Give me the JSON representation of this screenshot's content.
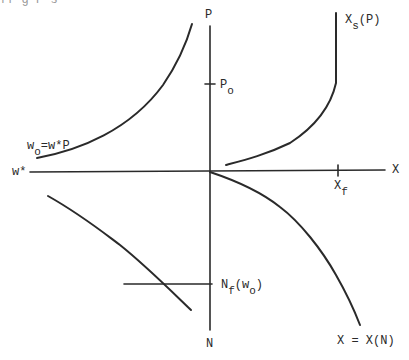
{
  "figure": {
    "top_fragment_text": "ff g    P  s",
    "axes": {
      "vertical_top_label": "P",
      "vertical_bottom_label": "N",
      "horizontal_right_label": "X",
      "horizontal_left_label": "w*"
    },
    "ticks": {
      "p0": {
        "main": "P",
        "sub": "o"
      },
      "xf": {
        "main": "X",
        "sub": "f"
      },
      "nf": {
        "main": "N",
        "sub": "f",
        "arg_open": "(w",
        "arg_sub": "o",
        "arg_close": ")"
      }
    },
    "curve_labels": {
      "xs": {
        "main": "X",
        "sub": "s",
        "rest": "(P)"
      },
      "w0": {
        "main": "w",
        "sub": "o",
        "rest": "=w*P"
      },
      "xn": "X = X(N)"
    },
    "colors": {
      "ink": "#2a2a2a",
      "background": "#ffffff"
    }
  }
}
